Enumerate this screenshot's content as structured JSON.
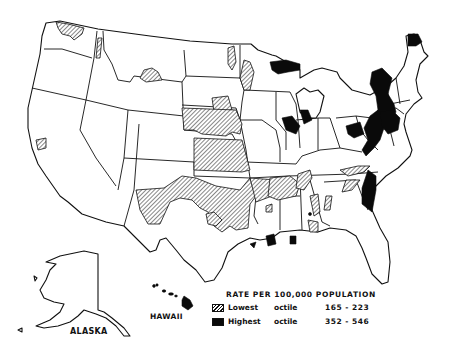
{
  "map": {
    "title": "RATE PER 100,000 POPULATION",
    "region": "United States (conterminous) with Alaska and Hawaii insets",
    "insets": [
      {
        "label": "ALASKA"
      },
      {
        "label": "HAWAII"
      }
    ],
    "legend": {
      "title": "RATE PER 100,000 POPULATION",
      "items": [
        {
          "pattern": "hatched",
          "name": "Lowest",
          "category": "octile",
          "range": "165 - 223",
          "min": 165,
          "max": 223
        },
        {
          "pattern": "solid-black",
          "name": "Highest",
          "category": "octile",
          "range": "352 - 546",
          "min": 352,
          "max": 546
        }
      ]
    },
    "colors": {
      "background": "#ffffff",
      "outline": "#111111",
      "highest": "#0a0a0a",
      "lowest": "hatched"
    },
    "highlighted_areas": {
      "highest_octile": [
        "Northeast (NY, PA, NJ, MA corridor)",
        "Northern Maine",
        "Upper Michigan",
        "Northern Wisconsin",
        "Southern Illinois/Chicago region",
        "Ohio/West Virginia area",
        "South Carolina coast",
        "Southern Louisiana",
        "Southeast Texas coast",
        "Hawaii"
      ],
      "lowest_octile": [
        "Northwest Washington",
        "Northern Idaho",
        "Southern Montana",
        "Minnesota west edge",
        "South Dakota east",
        "Nebraska",
        "Kansas",
        "Oklahoma",
        "West & Central Texas",
        "Arkansas",
        "North Louisiana",
        "Western Tennessee",
        "Mississippi/Alabama portions",
        "Georgia north",
        "Southern California coast"
      ]
    }
  }
}
